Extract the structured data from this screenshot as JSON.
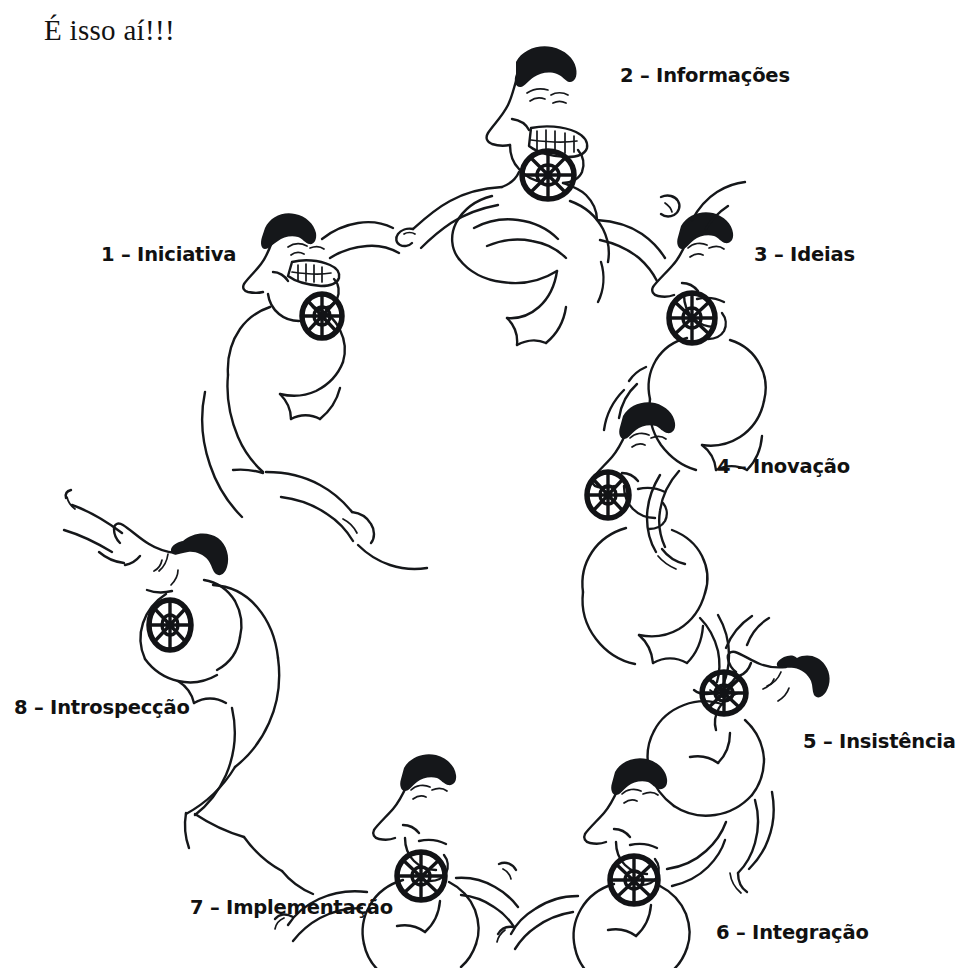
{
  "page": {
    "title": "É isso aí!!!",
    "background_color": "#ffffff",
    "ink_color": "#15171a",
    "medium": "hand-drawn ink illustration (scanned)"
  },
  "diagram": {
    "type": "cycle",
    "shape": "ring of eight figures holding hands",
    "figure_count": 8,
    "figure_description": "cartoon superhero man with slicked black pompadour hair, long pointed nose, grinning profile, muscular arms, ship's-wheel emblem on chest",
    "emblem": "ships-wheel",
    "steps": [
      {
        "number": "1",
        "separator": "–",
        "name": "Iniciativa",
        "label": "1 – Iniciativa",
        "angle_deg": 202,
        "pose": "standing, arm extended, pointing"
      },
      {
        "number": "2",
        "separator": "–",
        "name": "Informações",
        "label": "2 – Informações",
        "angle_deg": 262,
        "pose": "arms crossed over chest, broad grin"
      },
      {
        "number": "3",
        "separator": "–",
        "name": "Ideias",
        "label": "3 – Ideias",
        "angle_deg": 320,
        "pose": "facing left, thoughtful, arm raised"
      },
      {
        "number": "4",
        "separator": "–",
        "name": "Inovação",
        "label": "4 – Inovação",
        "angle_deg": 8,
        "pose": "upright profile, arm lowered to next figure"
      },
      {
        "number": "5",
        "separator": "–",
        "name": "Insistência",
        "label": "5 – Insistência",
        "angle_deg": 52,
        "pose": "tilted sideways, leaning into the ring"
      },
      {
        "number": "6",
        "separator": "–",
        "name": "Integração",
        "label": "6 – Integração",
        "angle_deg": 100,
        "pose": "standing, both hands linked to neighbours"
      },
      {
        "number": "7",
        "separator": "–",
        "name": "Implementação",
        "label": "7 – Implementação",
        "angle_deg": 140,
        "pose": "standing, both hands linked to neighbours"
      },
      {
        "number": "8",
        "separator": "–",
        "name": "Introspecção",
        "label": "8 – Introspecção",
        "angle_deg": 172,
        "pose": "flying / leaping upward with cape, arm outstretched"
      }
    ]
  }
}
